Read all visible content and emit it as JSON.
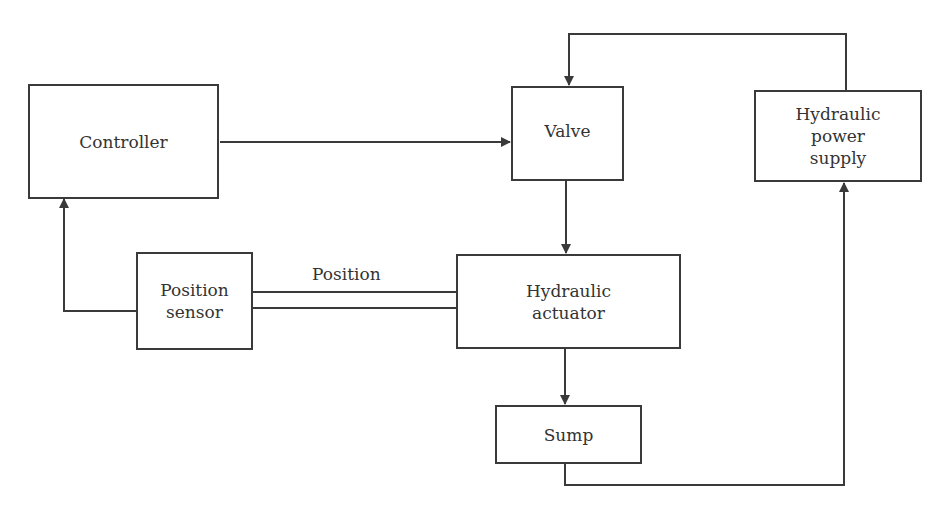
{
  "diagram": {
    "type": "block-diagram",
    "blocks": {
      "controller": "Controller",
      "valve": "Valve",
      "power_supply": "Hydraulic\npower\nsupply",
      "position_sensor": "Position\nsensor",
      "actuator": "Hydraulic\nactuator",
      "sump": "Sump"
    },
    "edge_labels": {
      "position": "Position"
    },
    "edges": [
      {
        "from": "Controller",
        "to": "Valve"
      },
      {
        "from": "Hydraulic power supply",
        "to": "Valve"
      },
      {
        "from": "Valve",
        "to": "Hydraulic actuator"
      },
      {
        "from": "Hydraulic actuator",
        "to": "Sump"
      },
      {
        "from": "Sump",
        "to": "Hydraulic power supply"
      },
      {
        "from": "Hydraulic actuator",
        "to": "Position sensor",
        "label": "Position"
      },
      {
        "from": "Position sensor",
        "to": "Controller"
      }
    ],
    "line_color": "#3a3a3a"
  }
}
